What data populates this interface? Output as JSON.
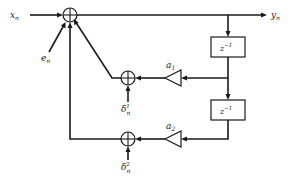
{
  "diagram": {
    "signals": {
      "input": "x",
      "input_sub": "n",
      "output": "y",
      "output_sub": "n",
      "error": "e",
      "error_sub": "n",
      "delta1": "δ",
      "delta1_sub": "n",
      "delta1_sup": "1",
      "delta2": "δ",
      "delta2_sub": "n",
      "delta2_sup": "2"
    },
    "blocks": {
      "delay1": "z",
      "delay1_exp": "−1",
      "delay2": "z",
      "delay2_exp": "−1"
    },
    "gains": {
      "a1": "a",
      "a1_sub": "1",
      "a2": "a",
      "a2_sub": "2"
    },
    "adders": [
      "main-sum",
      "sum-delta1",
      "sum-delta2"
    ],
    "colors": {
      "line": "#1a1a1a",
      "background": "#ffffff"
    }
  }
}
